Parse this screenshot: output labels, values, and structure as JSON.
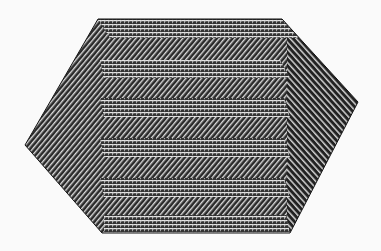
{
  "figure": {
    "colors": {
      "background": "#fafafa",
      "dark": "#222222",
      "light": "#e8e8e8"
    },
    "hexagon": [
      [
        98,
        19
      ],
      [
        282,
        19
      ],
      [
        358,
        102
      ],
      [
        290,
        233
      ],
      [
        102,
        233
      ],
      [
        25,
        145
      ]
    ],
    "crosshatch_bands": [
      [
        19,
        38
      ],
      [
        60,
        78
      ],
      [
        98,
        117
      ],
      [
        138,
        157
      ],
      [
        178,
        197
      ],
      [
        215,
        233
      ]
    ]
  }
}
